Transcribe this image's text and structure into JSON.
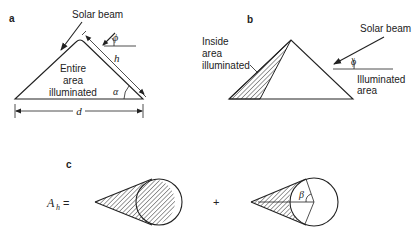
{
  "panels": {
    "a": {
      "label": "a",
      "solar_beam": "Solar beam",
      "region_text": [
        "Entire",
        "area",
        "illuminated"
      ],
      "symbols": {
        "phi": "ϕ",
        "h": "h",
        "alpha": "α",
        "d": "d"
      }
    },
    "b": {
      "label": "b",
      "solar_beam": "Solar beam",
      "inside_text": [
        "Inside",
        "area",
        "illuminated"
      ],
      "illum_text": [
        "Illuminated",
        "area"
      ],
      "symbols": {
        "phi": "ϕ"
      }
    },
    "c": {
      "label": "c",
      "lhs": "A",
      "lhs_sub": "h",
      "equals": "=",
      "plus": "+",
      "symbols": {
        "beta": "β"
      }
    }
  },
  "colors": {
    "ink": "#222222",
    "background": "#ffffff"
  }
}
